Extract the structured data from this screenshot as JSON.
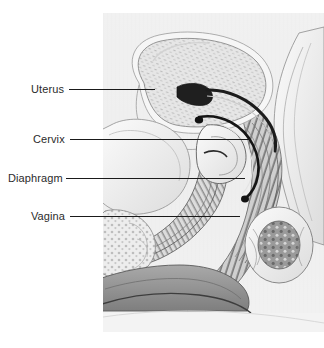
{
  "figure": {
    "panel": {
      "background_color": "#efefef",
      "x": 103,
      "y": 13,
      "width": 221,
      "height": 319
    },
    "text_color": "#2b2b2b",
    "leader_color": "#1a1a1a",
    "labels": [
      {
        "id": "uterus",
        "text": "Uterus",
        "text_x": 31,
        "text_y": 83,
        "leader_x": 69,
        "leader_y": 89,
        "leader_length": 86
      },
      {
        "id": "cervix",
        "text": "Cervix",
        "text_x": 33,
        "text_y": 133,
        "leader_x": 70,
        "leader_y": 139,
        "leader_length": 180
      },
      {
        "id": "diaphragm",
        "text": "Diaphragm",
        "text_x": 8,
        "text_y": 172,
        "leader_x": 66,
        "leader_y": 178,
        "leader_length": 179
      },
      {
        "id": "vagina",
        "text": "Vagina",
        "text_x": 31,
        "text_y": 210,
        "leader_x": 70,
        "leader_y": 216,
        "leader_length": 170
      }
    ],
    "structures": [
      {
        "id": "uterus-body",
        "name": "Uterus",
        "description": "pear-shaped anteverted uterine body with stippled myometrium"
      },
      {
        "id": "endometrial-cavity",
        "name": "Endometrial cavity",
        "description": "dark slit-like cavity within uterus"
      },
      {
        "id": "cervix",
        "name": "Cervix",
        "description": "neck of uterus projecting into vaginal vault"
      },
      {
        "id": "diaphragm",
        "name": "Diaphragm",
        "description": "dome-shaped contraceptive device seated over cervix"
      },
      {
        "id": "vagina",
        "name": "Vagina",
        "description": "rugated vaginal canal running downward and forward"
      },
      {
        "id": "bladder",
        "name": "Bladder",
        "description": "anterior bladder anterior to uterus"
      },
      {
        "id": "rectum",
        "name": "Rectum",
        "description": "posterior rectal canal with striated wall"
      },
      {
        "id": "sacrum",
        "name": "Sacrum",
        "description": "posterior bony sacral curve"
      },
      {
        "id": "pubic-bone",
        "name": "Pubic bone",
        "description": "anterior inferior bony landmark"
      },
      {
        "id": "perineum",
        "name": "Perineum",
        "description": "mid-gray soft tissue wedge at inferior margin"
      }
    ],
    "palette": {
      "panel_bg": "#efefef",
      "tissue_light": "#f7f7f7",
      "tissue_mid": "#cfcfcf",
      "tissue_dark": "#8a8a8a",
      "shadow": "#4a4a4a",
      "outline": "#5d5d5d",
      "ink": "#1a1a1a"
    }
  }
}
